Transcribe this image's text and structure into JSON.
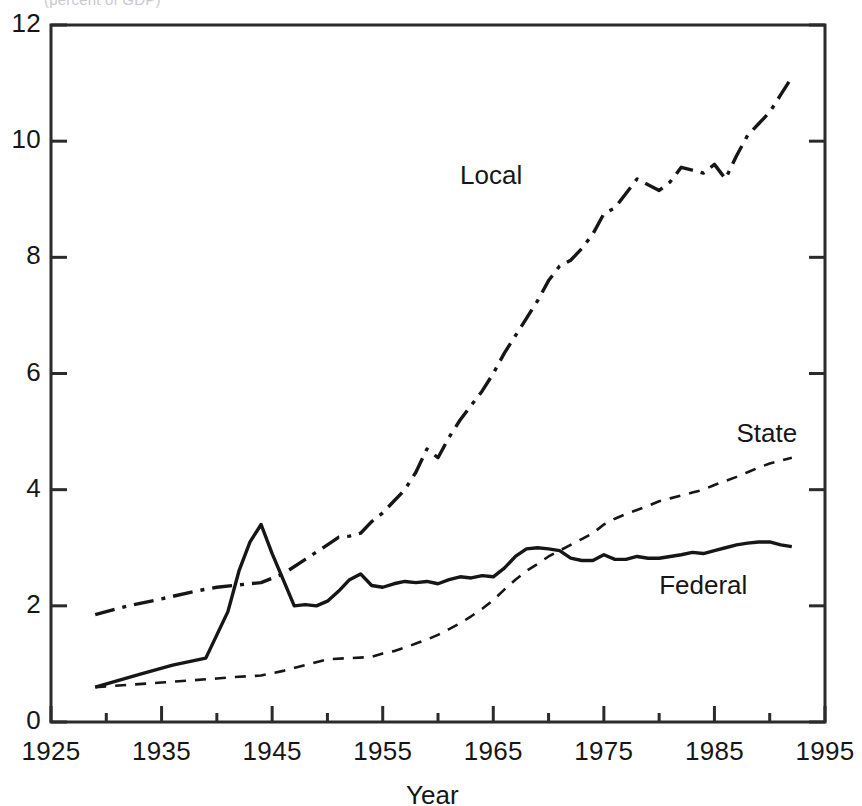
{
  "figure": {
    "top_caption_fragment": "(percent of GDP)",
    "xlabel": "Year",
    "ylabel": ""
  },
  "axis": {
    "x_ticks": [
      "1925",
      "1935",
      "1945",
      "1955",
      "1965",
      "1975",
      "1985",
      "1995"
    ],
    "y_ticks": [
      "0",
      "2",
      "4",
      "6",
      "8",
      "10",
      "12"
    ]
  },
  "series_labels": {
    "local": "Local",
    "state": "State",
    "federal": "Federal"
  },
  "chart_data": {
    "type": "line",
    "title": "",
    "subtitle": "",
    "xlabel": "Year",
    "ylabel": "",
    "xlim": [
      1925,
      1995
    ],
    "ylim": [
      0,
      12
    ],
    "x_ticks": [
      1925,
      1935,
      1945,
      1955,
      1965,
      1975,
      1985,
      1995
    ],
    "y_ticks": [
      0,
      2,
      4,
      6,
      8,
      10,
      12
    ],
    "x_minor_tick_step": 5,
    "grid": false,
    "legend": "inline-annotations",
    "annotations": [
      {
        "text": "Local",
        "x": 1962,
        "y": 9.4
      },
      {
        "text": "State",
        "x": 1987,
        "y": 4.95
      },
      {
        "text": "Federal",
        "x": 1980,
        "y": 2.35
      }
    ],
    "series": [
      {
        "name": "Local",
        "style": "dash-dot",
        "color": "#161616",
        "x": [
          1929,
          1932,
          1935,
          1938,
          1940,
          1942,
          1944,
          1946,
          1948,
          1950,
          1951,
          1952,
          1953,
          1954,
          1955,
          1956,
          1957,
          1958,
          1959,
          1960,
          1961,
          1962,
          1963,
          1964,
          1965,
          1966,
          1967,
          1968,
          1969,
          1970,
          1971,
          1972,
          1973,
          1974,
          1975,
          1976,
          1977,
          1978,
          1979,
          1980,
          1981,
          1982,
          1983,
          1984,
          1985,
          1986,
          1987,
          1988,
          1989,
          1990,
          1991,
          1992
        ],
        "values": [
          1.85,
          2.0,
          2.12,
          2.25,
          2.32,
          2.36,
          2.4,
          2.55,
          2.8,
          3.05,
          3.18,
          3.2,
          3.25,
          3.45,
          3.6,
          3.8,
          4.0,
          4.3,
          4.7,
          4.55,
          4.9,
          5.2,
          5.45,
          5.7,
          6.0,
          6.35,
          6.65,
          6.95,
          7.25,
          7.6,
          7.85,
          7.95,
          8.15,
          8.4,
          8.75,
          8.85,
          9.1,
          9.35,
          9.25,
          9.15,
          9.3,
          9.55,
          9.5,
          9.45,
          9.6,
          9.35,
          9.75,
          10.1,
          10.3,
          10.5,
          10.8,
          11.1
        ]
      },
      {
        "name": "State",
        "style": "dashed",
        "color": "#161616",
        "x": [
          1929,
          1932,
          1935,
          1938,
          1940,
          1942,
          1944,
          1946,
          1948,
          1950,
          1952,
          1954,
          1955,
          1956,
          1957,
          1958,
          1959,
          1960,
          1961,
          1962,
          1963,
          1964,
          1965,
          1966,
          1967,
          1968,
          1969,
          1970,
          1971,
          1972,
          1973,
          1974,
          1975,
          1976,
          1977,
          1978,
          1979,
          1980,
          1981,
          1982,
          1983,
          1984,
          1985,
          1986,
          1987,
          1988,
          1989,
          1990,
          1991,
          1992
        ],
        "values": [
          0.6,
          0.64,
          0.68,
          0.72,
          0.75,
          0.78,
          0.8,
          0.88,
          0.98,
          1.08,
          1.1,
          1.12,
          1.18,
          1.22,
          1.28,
          1.35,
          1.42,
          1.5,
          1.6,
          1.7,
          1.82,
          1.95,
          2.1,
          2.28,
          2.45,
          2.6,
          2.72,
          2.85,
          2.95,
          3.05,
          3.15,
          3.25,
          3.4,
          3.5,
          3.58,
          3.65,
          3.72,
          3.8,
          3.85,
          3.9,
          3.95,
          4.0,
          4.08,
          4.15,
          4.22,
          4.3,
          4.38,
          4.45,
          4.5,
          4.55
        ]
      },
      {
        "name": "Federal",
        "style": "solid",
        "color": "#161616",
        "x": [
          1929,
          1933,
          1936,
          1939,
          1941,
          1942,
          1943,
          1944,
          1945,
          1946,
          1947,
          1948,
          1949,
          1950,
          1951,
          1952,
          1953,
          1954,
          1955,
          1956,
          1957,
          1958,
          1959,
          1960,
          1961,
          1962,
          1963,
          1964,
          1965,
          1966,
          1967,
          1968,
          1969,
          1970,
          1971,
          1972,
          1973,
          1974,
          1975,
          1976,
          1977,
          1978,
          1979,
          1980,
          1981,
          1982,
          1983,
          1984,
          1985,
          1986,
          1987,
          1988,
          1989,
          1990,
          1991,
          1992
        ],
        "values": [
          0.6,
          0.82,
          0.98,
          1.1,
          1.9,
          2.6,
          3.1,
          3.4,
          2.9,
          2.45,
          2.0,
          2.02,
          2.0,
          2.08,
          2.25,
          2.45,
          2.55,
          2.35,
          2.32,
          2.38,
          2.42,
          2.4,
          2.42,
          2.38,
          2.45,
          2.5,
          2.48,
          2.52,
          2.5,
          2.65,
          2.85,
          2.98,
          3.0,
          2.98,
          2.95,
          2.82,
          2.78,
          2.78,
          2.88,
          2.8,
          2.8,
          2.85,
          2.82,
          2.82,
          2.85,
          2.88,
          2.92,
          2.9,
          2.95,
          3.0,
          3.05,
          3.08,
          3.1,
          3.1,
          3.05,
          3.02
        ]
      }
    ]
  }
}
